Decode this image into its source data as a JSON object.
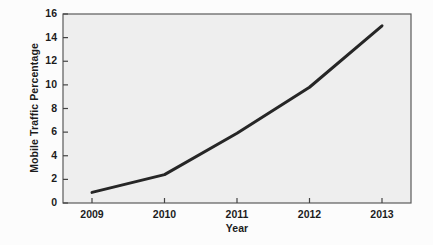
{
  "chart_data": {
    "type": "line",
    "title": "",
    "xlabel": "Year",
    "ylabel": "Mobile Traffic Percentage",
    "x": [
      2009,
      2010,
      2011,
      2012,
      2013
    ],
    "categories": [
      "2009",
      "2010",
      "2011",
      "2012",
      "2013"
    ],
    "values": [
      0.9,
      2.4,
      5.9,
      9.8,
      15.0
    ],
    "series": [
      {
        "name": "Mobile Traffic Percentage",
        "values": [
          0.9,
          2.4,
          5.9,
          9.8,
          15.0
        ]
      }
    ],
    "xlim": [
      2008.6,
      2013.4
    ],
    "ylim": [
      0,
      16
    ],
    "yticks": [
      0,
      2,
      4,
      6,
      8,
      10,
      12,
      14,
      16
    ],
    "ytick_labels": [
      "0",
      "2",
      "4",
      "6",
      "8",
      "10",
      "12",
      "14",
      "16"
    ],
    "xticks": [
      2009,
      2010,
      2011,
      2012,
      2013
    ],
    "xtick_labels": [
      "2009",
      "2010",
      "2011",
      "2012",
      "2013"
    ],
    "grid": false,
    "legend": false,
    "legend_position": "none",
    "line_color": "#262626",
    "line_width": 3,
    "plot_background": "#eeeeee",
    "figure_background": "#fcfcfc",
    "axis_color": "#555555"
  },
  "axes": {
    "x_label": "Year",
    "y_label": "Mobile Traffic Percentage"
  }
}
